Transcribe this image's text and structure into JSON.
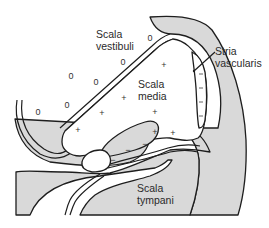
{
  "diagram": {
    "labels": {
      "scala_vestibuli": [
        "Scala",
        "vestibuli"
      ],
      "scala_media": [
        "Scala",
        "media"
      ],
      "stria_vascularis": [
        "Stria",
        "vascularis"
      ],
      "scala_tympani": [
        "Scala",
        "tympani"
      ]
    },
    "symbols": {
      "zero": "0",
      "plus": "+",
      "minus": "−"
    },
    "colors": {
      "tissue": "#d9d9d9",
      "outline": "#1e1e1e",
      "text": "#2a2a2a",
      "background": "#ffffff"
    }
  }
}
